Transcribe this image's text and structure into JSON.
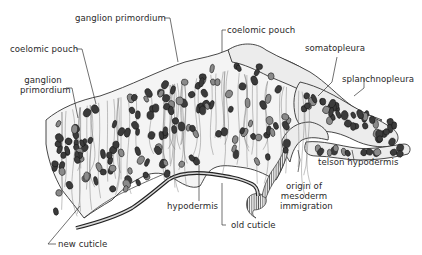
{
  "figure": {
    "labels": {
      "ganglion_primordium_top": "ganglion primordium",
      "coelomic_pouch_left": "coelomic pouch",
      "ganglion_primordium_left_line1": "ganglion",
      "ganglion_primordium_left_line2": "primordium",
      "coelomic_pouch_top": "coelomic pouch",
      "somatopleura": "somatopleura",
      "splanchnopleura": "splanchnopleura",
      "telson_hypodermis": "telson hypodermis",
      "origin_line1": "origin of",
      "origin_line2": "mesoderm",
      "origin_line3": "immigration",
      "hypodermis": "hypodermis",
      "old_cuticle": "old cuticle",
      "new_cuticle": "new cuticle"
    }
  }
}
